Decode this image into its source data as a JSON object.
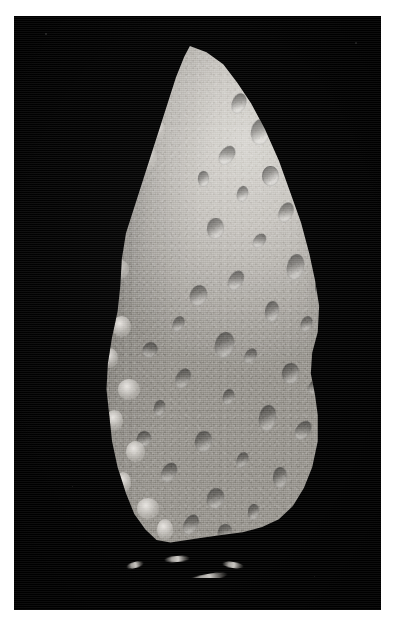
{
  "image": {
    "type": "natural-image",
    "subject": "asteroid",
    "caption": "Grayscale spacecraft photograph of an irregular, elongated asteroid illuminated from the upper right against the black of space.",
    "orientation": "portrait",
    "palette": {
      "background_white": "#ffffff",
      "space_black": "#010101",
      "terminator_shadow": "#000000",
      "surface_midtone": "#9a9792",
      "surface_highlight": "#d9d7d2",
      "surface_shadow": "#6f6c67"
    },
    "frame": {
      "left": 14,
      "top": 16,
      "width": 367,
      "height": 594
    },
    "lighting": {
      "sun_direction": "upper-right",
      "terminator_side": "left"
    }
  },
  "sky_specks": [
    {
      "x": 31,
      "y": 17,
      "size": 2.2,
      "brightness": "#2e2e2e"
    },
    {
      "x": 341,
      "y": 26,
      "size": 2.0,
      "brightness": "#262626"
    },
    {
      "x": 58,
      "y": 470,
      "size": 1.4,
      "brightness": "#1d1d1d"
    },
    {
      "x": 300,
      "y": 560,
      "size": 1.3,
      "brightness": "#1b1b1b"
    }
  ],
  "asteroid": {
    "bounds": {
      "left": 48,
      "top": 30,
      "width": 278,
      "height": 520
    },
    "silhouette_note": "Pointed apex near the top-left-of-center, bulging smooth limb down the right side, ragged shadowed terminator down the left, broad rounded base.",
    "craters": [
      {
        "x": 61,
        "y": 9,
        "w": 5,
        "h": 4,
        "rot": 20
      },
      {
        "x": 68,
        "y": 14,
        "w": 7,
        "h": 5,
        "rot": 10
      },
      {
        "x": 57,
        "y": 19,
        "w": 5,
        "h": 4,
        "rot": 35
      },
      {
        "x": 72,
        "y": 23,
        "w": 6,
        "h": 4,
        "rot": 0
      },
      {
        "x": 63,
        "y": 27,
        "w": 4,
        "h": 3,
        "rot": 15
      },
      {
        "x": 78,
        "y": 30,
        "w": 5,
        "h": 4,
        "rot": 25
      },
      {
        "x": 52,
        "y": 33,
        "w": 6,
        "h": 4,
        "rot": 5
      },
      {
        "x": 69,
        "y": 36,
        "w": 4,
        "h": 3,
        "rot": 40
      },
      {
        "x": 81,
        "y": 40,
        "w": 6,
        "h": 5,
        "rot": 12
      },
      {
        "x": 60,
        "y": 43,
        "w": 5,
        "h": 4,
        "rot": 30
      },
      {
        "x": 46,
        "y": 46,
        "w": 6,
        "h": 4,
        "rot": 18
      },
      {
        "x": 73,
        "y": 49,
        "w": 5,
        "h": 4,
        "rot": 8
      },
      {
        "x": 86,
        "y": 52,
        "w": 4,
        "h": 3,
        "rot": 22
      },
      {
        "x": 55,
        "y": 55,
        "w": 7,
        "h": 5,
        "rot": 14
      },
      {
        "x": 66,
        "y": 58,
        "w": 4,
        "h": 3,
        "rot": 33
      },
      {
        "x": 79,
        "y": 61,
        "w": 6,
        "h": 4,
        "rot": 6
      },
      {
        "x": 41,
        "y": 62,
        "w": 5,
        "h": 4,
        "rot": 27
      },
      {
        "x": 58,
        "y": 66,
        "w": 4,
        "h": 3,
        "rot": 16
      },
      {
        "x": 71,
        "y": 69,
        "w": 6,
        "h": 5,
        "rot": 9
      },
      {
        "x": 84,
        "y": 72,
        "w": 5,
        "h": 4,
        "rot": 36
      },
      {
        "x": 48,
        "y": 74,
        "w": 6,
        "h": 4,
        "rot": 11
      },
      {
        "x": 63,
        "y": 78,
        "w": 4,
        "h": 3,
        "rot": 24
      },
      {
        "x": 76,
        "y": 81,
        "w": 5,
        "h": 4,
        "rot": 3
      },
      {
        "x": 36,
        "y": 80,
        "w": 5,
        "h": 4,
        "rot": 31
      },
      {
        "x": 52,
        "y": 85,
        "w": 6,
        "h": 4,
        "rot": 19
      },
      {
        "x": 67,
        "y": 88,
        "w": 4,
        "h": 3,
        "rot": 7
      },
      {
        "x": 44,
        "y": 90,
        "w": 5,
        "h": 4,
        "rot": 28
      },
      {
        "x": 29,
        "y": 57,
        "w": 5,
        "h": 3,
        "rot": 42
      },
      {
        "x": 33,
        "y": 68,
        "w": 4,
        "h": 3,
        "rot": 13
      },
      {
        "x": 27,
        "y": 74,
        "w": 5,
        "h": 3,
        "rot": 21
      },
      {
        "x": 88,
        "y": 26,
        "w": 4,
        "h": 3,
        "rot": 17
      },
      {
        "x": 83,
        "y": 17,
        "w": 4,
        "h": 3,
        "rot": 29
      },
      {
        "x": 75,
        "y": 12,
        "w": 4,
        "h": 3,
        "rot": 38
      },
      {
        "x": 49,
        "y": 24,
        "w": 4,
        "h": 3,
        "rot": 2
      },
      {
        "x": 40,
        "y": 52,
        "w": 4,
        "h": 3,
        "rot": 26
      },
      {
        "x": 89,
        "y": 64,
        "w": 4,
        "h": 3,
        "rot": 34
      },
      {
        "x": 91,
        "y": 45,
        "w": 3,
        "h": 3,
        "rot": 0
      },
      {
        "x": 56,
        "y": 92,
        "w": 5,
        "h": 3,
        "rot": 15
      },
      {
        "x": 70,
        "y": 94,
        "w": 4,
        "h": 3,
        "rot": 23
      },
      {
        "x": 82,
        "y": 88,
        "w": 4,
        "h": 3,
        "rot": 10
      }
    ],
    "terminator_knobs": [
      {
        "x": 13,
        "y": 33,
        "w": 9,
        "h": 5
      },
      {
        "x": 9,
        "y": 37,
        "w": 7,
        "h": 4
      },
      {
        "x": 16,
        "y": 41,
        "w": 8,
        "h": 4
      },
      {
        "x": 11,
        "y": 45,
        "w": 6,
        "h": 4
      },
      {
        "x": 19,
        "y": 29,
        "w": 7,
        "h": 4
      },
      {
        "x": 22,
        "y": 24,
        "w": 6,
        "h": 4
      },
      {
        "x": 26,
        "y": 19,
        "w": 8,
        "h": 5
      },
      {
        "x": 31,
        "y": 14,
        "w": 6,
        "h": 4
      },
      {
        "x": 18,
        "y": 52,
        "w": 7,
        "h": 4
      },
      {
        "x": 14,
        "y": 58,
        "w": 6,
        "h": 4
      },
      {
        "x": 20,
        "y": 64,
        "w": 8,
        "h": 4
      },
      {
        "x": 16,
        "y": 70,
        "w": 6,
        "h": 4
      },
      {
        "x": 23,
        "y": 76,
        "w": 7,
        "h": 4
      },
      {
        "x": 19,
        "y": 82,
        "w": 6,
        "h": 4
      },
      {
        "x": 27,
        "y": 87,
        "w": 8,
        "h": 4
      },
      {
        "x": 34,
        "y": 91,
        "w": 6,
        "h": 4
      },
      {
        "x": 7,
        "y": 49,
        "w": 5,
        "h": 3
      },
      {
        "x": 5,
        "y": 54,
        "w": 4,
        "h": 3
      },
      {
        "x": 24,
        "y": 10,
        "w": 5,
        "h": 3
      },
      {
        "x": 30,
        "y": 6,
        "w": 5,
        "h": 3
      }
    ],
    "ridge_fragments": [
      {
        "x": 10,
        "y": 52,
        "w": 56,
        "h": 9,
        "rot": -6
      },
      {
        "x": 62,
        "y": 42,
        "w": 40,
        "h": 7,
        "rot": -10
      },
      {
        "x": 38,
        "y": 24,
        "w": 26,
        "h": 6,
        "rot": -4
      },
      {
        "x": 96,
        "y": 30,
        "w": 22,
        "h": 6,
        "rot": 8
      },
      {
        "x": 0,
        "y": 30,
        "w": 18,
        "h": 6,
        "rot": -14
      }
    ]
  }
}
